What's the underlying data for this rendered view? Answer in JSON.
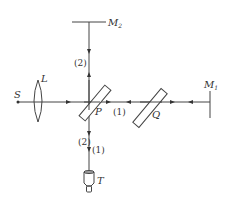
{
  "diagram": {
    "type": "Michelson interferometer optical setup",
    "labels": {
      "source": "S",
      "lens": "L",
      "beam_splitter": "P",
      "compensator": "Q",
      "mirror1": "M",
      "mirror1_sub": "1",
      "mirror2": "M",
      "mirror2_sub": "2",
      "detector": "T",
      "path1": "(1)",
      "path2": "(2)",
      "path2_lower": "(2)",
      "path1_lower": "(1)"
    },
    "colors": {
      "line": "#444444",
      "background": "#ffffff"
    }
  }
}
